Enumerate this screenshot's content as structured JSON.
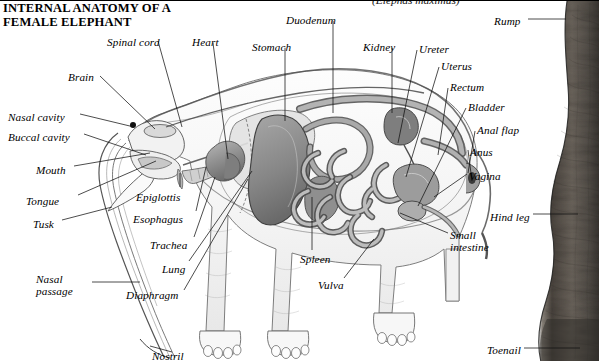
{
  "figure": {
    "title": "INTERNAL ANATOMY OF A\nFEMALE ELEPHANT",
    "scientific_name": "(Elephas maximus)",
    "style": "pencil-sketch-greyscale-anatomical-cutaway",
    "colors": {
      "background": "#ffffff",
      "ink": "#000000",
      "leader_line": "#1a1a1a",
      "body_outline": "#5a5a5a",
      "organ_mid": "#9a9a9a",
      "organ_dark": "#6b6b6b",
      "organ_light": "#c9c9c9",
      "skin_photo_dark": "#3b3632",
      "skin_photo_mid": "#6f675f"
    }
  },
  "labels": {
    "top_left": [
      {
        "text": "Spinal cord",
        "x": 107,
        "y": 35
      },
      {
        "text": "Heart",
        "x": 192,
        "y": 35
      },
      {
        "text": "Stomach",
        "x": 252,
        "y": 40
      },
      {
        "text": "Duodenum",
        "x": 286,
        "y": 13
      },
      {
        "text": "Brain",
        "x": 68,
        "y": 70
      }
    ],
    "left": [
      {
        "text": "Nasal cavity",
        "x": 8,
        "y": 110
      },
      {
        "text": "Buccal cavity",
        "x": 8,
        "y": 130
      },
      {
        "text": "Mouth",
        "x": 36,
        "y": 163
      },
      {
        "text": "Tongue",
        "x": 26,
        "y": 194
      },
      {
        "text": "Tusk",
        "x": 33,
        "y": 217
      },
      {
        "text": "Nasal\npassage",
        "x": 36,
        "y": 272
      }
    ],
    "center_bottom": [
      {
        "text": "Epiglottis",
        "x": 136,
        "y": 190
      },
      {
        "text": "Esophagus",
        "x": 133,
        "y": 212
      },
      {
        "text": "Trachea",
        "x": 150,
        "y": 238
      },
      {
        "text": "Lung",
        "x": 162,
        "y": 262
      },
      {
        "text": "Diaphragm",
        "x": 126,
        "y": 288
      },
      {
        "text": "Spleen",
        "x": 300,
        "y": 252
      },
      {
        "text": "Vulva",
        "x": 318,
        "y": 278
      },
      {
        "text": "Nostril",
        "x": 152,
        "y": 349
      }
    ],
    "right": [
      {
        "text": "Kidney",
        "x": 363,
        "y": 40
      },
      {
        "text": "Ureter",
        "x": 419,
        "y": 42
      },
      {
        "text": "Uterus",
        "x": 441,
        "y": 59
      },
      {
        "text": "Rectum",
        "x": 450,
        "y": 80
      },
      {
        "text": "Bladder",
        "x": 468,
        "y": 100
      },
      {
        "text": "Anal flap",
        "x": 477,
        "y": 123
      },
      {
        "text": "Anus",
        "x": 470,
        "y": 145
      },
      {
        "text": "Vagina",
        "x": 469,
        "y": 169
      },
      {
        "text": "Rump",
        "x": 494,
        "y": 14
      },
      {
        "text": "Hind leg",
        "x": 490,
        "y": 210
      },
      {
        "text": "Small\nintestine",
        "x": 450,
        "y": 228
      },
      {
        "text": "Toenail",
        "x": 487,
        "y": 343
      }
    ]
  }
}
